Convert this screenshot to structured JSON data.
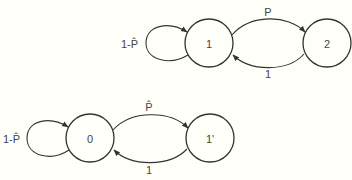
{
  "colors": {
    "background": "#fffffa",
    "stroke": "#333333",
    "text": "#444444"
  },
  "diagrams": [
    {
      "name": "top-chain",
      "nodes": [
        {
          "id": "1",
          "label": "1",
          "cx": 209,
          "cy": 43,
          "r": 24
        },
        {
          "id": "2",
          "label": "2",
          "cx": 327,
          "cy": 43,
          "r": 24
        }
      ],
      "self_loop": {
        "node": "1",
        "label": "1-P̂"
      },
      "edges": [
        {
          "from": "1",
          "to": "2",
          "label": "P"
        },
        {
          "from": "2",
          "to": "1",
          "label": "1"
        }
      ]
    },
    {
      "name": "bottom-chain",
      "nodes": [
        {
          "id": "0",
          "label": "0",
          "cx": 90,
          "cy": 138,
          "r": 24
        },
        {
          "id": "1'",
          "label": "1'",
          "cx": 210,
          "cy": 138,
          "r": 24
        }
      ],
      "self_loop": {
        "node": "0",
        "label": "1-P̂"
      },
      "edges": [
        {
          "from": "0",
          "to": "1'",
          "label": "P̂"
        },
        {
          "from": "1'",
          "to": "0",
          "label": "1"
        }
      ]
    }
  ]
}
